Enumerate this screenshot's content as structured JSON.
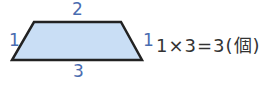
{
  "diagram": {
    "shape": "trapezoid",
    "fill": "#c9def5",
    "stroke": "#222222",
    "labels": {
      "top": "2",
      "left": "1",
      "right": "1",
      "bottom": "3"
    },
    "label_color": "#4a6cb0"
  },
  "equation": "1×3=3(個)"
}
